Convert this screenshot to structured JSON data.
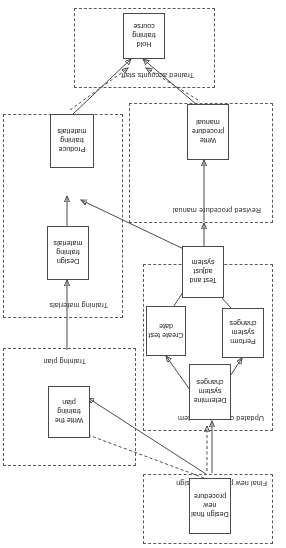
{
  "diagram": {
    "type": "process-flow",
    "orientation": "rotated-180",
    "groups": [
      {
        "id": "g-final-design",
        "label": "Final new procedure design"
      },
      {
        "id": "g-updated-system",
        "label": "Updated computer system"
      },
      {
        "id": "g-training-plan",
        "label": "Training plan"
      },
      {
        "id": "g-revised-manual",
        "label": "Revised procedure manual"
      },
      {
        "id": "g-training-mats",
        "label": "Training materials"
      },
      {
        "id": "g-trained-staff",
        "label": "Trained accounts staff"
      }
    ],
    "nodes": [
      {
        "id": "design-final-procedure",
        "label": "Design final new procedure"
      },
      {
        "id": "determine-system-changes",
        "label": "Determine system changes"
      },
      {
        "id": "perform-system-changes",
        "label": "Perform system changes"
      },
      {
        "id": "create-test-date",
        "label": "Create test date"
      },
      {
        "id": "test-adjust-system",
        "label": "Test and adjust system"
      },
      {
        "id": "write-procedure-manual",
        "label": "Write procedure manual"
      },
      {
        "id": "write-training-plan",
        "label": "Write the training plan"
      },
      {
        "id": "design-training-materials",
        "label": "Design training materials"
      },
      {
        "id": "produce-training-materials",
        "label": "Produce training materials"
      },
      {
        "id": "hold-training-course",
        "label": "Hold training course"
      }
    ],
    "colors": {
      "node_border": "#4a4a4a",
      "group_border": "#5a5a5a",
      "connector": "#4a4a4a",
      "background": "#ffffff",
      "text": "#1a1a1a"
    }
  }
}
